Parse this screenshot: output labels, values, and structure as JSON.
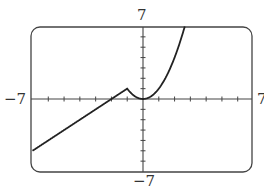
{
  "chart_data": {
    "type": "line",
    "title": "",
    "xlabel": "",
    "ylabel": "",
    "xlim": [
      -7,
      7
    ],
    "ylim": [
      -7,
      7
    ],
    "grid": false,
    "tick_step": 1,
    "tick_labels": {
      "x_min": "−7",
      "x_max": "7",
      "y_min": "−7",
      "y_max": "7"
    },
    "series": [
      {
        "name": "f(x)",
        "description": "piecewise: f(x) = x + 2 for x < -1; f(x) = x^2 for x >= -1",
        "x": [
          -7,
          -2,
          -1,
          -0.5,
          0,
          0.5,
          1,
          1.5,
          2,
          2.5,
          2.65
        ],
        "y": [
          -5,
          0,
          1,
          0.25,
          0,
          0.25,
          1,
          2.25,
          4,
          6.25,
          7
        ]
      }
    ]
  },
  "colors": {
    "curve": "#222222",
    "frame": "#444444",
    "axis": "#444444"
  }
}
